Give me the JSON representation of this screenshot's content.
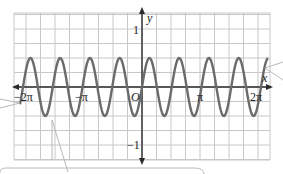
{
  "chart_data": {
    "type": "line",
    "title": "",
    "function": "y = 1/2 sin(4x)",
    "xlabel": "x",
    "ylabel": "y",
    "xlim": [
      -6.6,
      6.9
    ],
    "ylim": [
      -1.25,
      1.25
    ],
    "grid": true,
    "x_ticks": [
      {
        "value": -6.2832,
        "label": "−2π"
      },
      {
        "value": -3.1416,
        "label": "−π"
      },
      {
        "value": 0,
        "label": "O"
      },
      {
        "value": 3.1416,
        "label": "π"
      },
      {
        "value": 6.2832,
        "label": "2π"
      }
    ],
    "y_ticks": [
      {
        "value": 1,
        "label": "1"
      },
      {
        "value": -1,
        "label": "−1"
      }
    ],
    "series": [
      {
        "name": "y = ½ sin 4x",
        "amplitude": 0.5,
        "period": 1.5708,
        "color": "#6b6b6b"
      }
    ]
  },
  "axis_labels": {
    "x": "x",
    "y": "y",
    "origin": "O",
    "neg_two_pi": "−2π",
    "neg_pi": "−π",
    "pi": "π",
    "two_pi": "2π",
    "one": "1",
    "neg_one": "−1"
  },
  "colors": {
    "grid": "#c8c8c8",
    "axis": "#2a2a2a",
    "curve": "#6b6b6b",
    "callout": "#b8b8b8"
  }
}
